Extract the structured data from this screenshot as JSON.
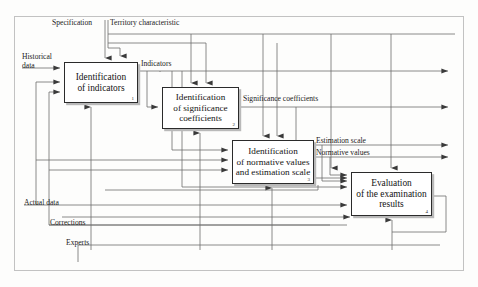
{
  "diagram": {
    "type": "idef0-process-flow",
    "frame": {
      "color": "#bdbdbd"
    },
    "line_color": "#6d6d6d",
    "box_border_color": "#2b2b2b",
    "processes": [
      {
        "id": "1",
        "number": "1",
        "label": "Identification\nof indicators"
      },
      {
        "id": "2",
        "number": "2",
        "label": "Identification\nof significance\ncoefficients"
      },
      {
        "id": "3",
        "number": "3",
        "label": "Identification\nof normative values\nand estimation scale"
      },
      {
        "id": "4",
        "number": "4",
        "label": "Evaluation\nof the examination\nresults"
      }
    ],
    "flow_labels": {
      "specification": "Specification",
      "territory_characteristic": "Territory characteristic",
      "historical_data": "Historical\ndata",
      "indicators": "Indicators",
      "significance_coefficients": "Significance coefficients",
      "estimation_scale": "Estimation scale",
      "normative_values": "Normative values",
      "actual_data": "Actual data",
      "corrections": "Corrections",
      "experts": "Experts"
    }
  }
}
